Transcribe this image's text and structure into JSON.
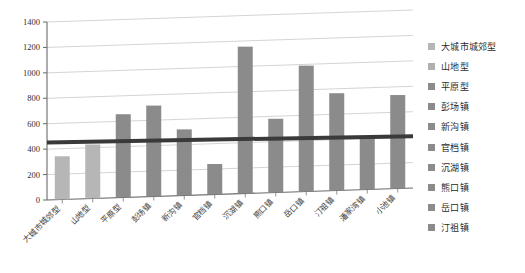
{
  "chart_data": {
    "type": "bar",
    "title": "",
    "xlabel": "",
    "ylabel": "",
    "ylim": [
      0,
      1400
    ],
    "yticks": [
      0,
      200,
      400,
      600,
      800,
      1000,
      1200,
      1400
    ],
    "grid": true,
    "legend_position": "right",
    "categories": [
      "大城市城郊型",
      "山地型",
      "平原型",
      "彭场镇",
      "新沟镇",
      "官档镇",
      "沉湖镇",
      "熊口镇",
      "岳口镇",
      "汀祖镇",
      "潘家湾镇",
      "小池镇"
    ],
    "values": [
      340,
      425,
      655,
      715,
      520,
      240,
      1155,
      580,
      990,
      765,
      420,
      735
    ],
    "bar_colors": [
      "#b6b6b6",
      "#b6b6b6",
      "#8b8b8b",
      "#8b8b8b",
      "#8b8b8b",
      "#8b8b8b",
      "#8b8b8b",
      "#8b8b8b",
      "#8b8b8b",
      "#8b8b8b",
      "#8b8b8b",
      "#8b8b8b"
    ],
    "trendline": {
      "name": "trend",
      "color": "#3a3a3a",
      "start_value": 452,
      "end_value": 408,
      "width_px": 4
    }
  },
  "legend": {
    "items": [
      {
        "label": "大城市城郊型",
        "color": "#b6b6b6"
      },
      {
        "label": "山地型",
        "color": "#b0b0b0"
      },
      {
        "label": "平原型",
        "color": "#8b8b8b"
      },
      {
        "label": "彭场镇",
        "color": "#8b8b8b"
      },
      {
        "label": "新沟镇",
        "color": "#8b8b8b"
      },
      {
        "label": "官档镇",
        "color": "#8b8b8b"
      },
      {
        "label": "沉湖镇",
        "color": "#8b8b8b"
      },
      {
        "label": "熊口镇",
        "color": "#8b8b8b"
      },
      {
        "label": "岳口镇",
        "color": "#8b8b8b"
      },
      {
        "label": "汀祖镇",
        "color": "#8b8b8b"
      }
    ]
  },
  "axis": {
    "y_tick_labels": [
      "1400",
      "1200",
      "1000",
      "800",
      "600",
      "400",
      "200",
      "0"
    ]
  }
}
